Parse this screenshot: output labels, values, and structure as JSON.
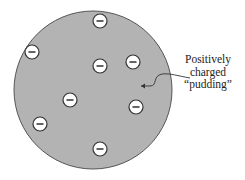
{
  "diagram": {
    "sphere": {
      "cx": 93,
      "cy": 90,
      "r": 79,
      "fill": "#b3b3b3",
      "stroke": "#555555"
    },
    "electrons": [
      {
        "x": 100,
        "y": 21,
        "symbol": "−"
      },
      {
        "x": 32,
        "y": 52,
        "symbol": "−"
      },
      {
        "x": 100,
        "y": 66,
        "symbol": "−"
      },
      {
        "x": 133,
        "y": 62,
        "symbol": "−"
      },
      {
        "x": 70,
        "y": 100,
        "symbol": "−"
      },
      {
        "x": 136,
        "y": 107,
        "symbol": "−"
      },
      {
        "x": 40,
        "y": 124,
        "symbol": "−"
      },
      {
        "x": 100,
        "y": 149,
        "symbol": "−"
      }
    ],
    "label": {
      "line1": "Positively",
      "line2": "charged",
      "line3": "“pudding”"
    }
  }
}
